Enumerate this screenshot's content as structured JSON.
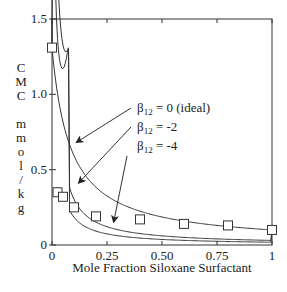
{
  "chart_data": {
    "type": "line",
    "title": "",
    "xlabel": "Mole Fraction Siloxane Surfactant",
    "ylabel": "CMC mmol/kg",
    "ylabel_chars": [
      "C",
      "M",
      "C",
      "",
      "m",
      "m",
      "o",
      "l",
      "/",
      "k",
      "g"
    ],
    "xlim": [
      0,
      1
    ],
    "ylim": [
      0,
      1.5
    ],
    "xticks": [
      0,
      0.25,
      0.5,
      0.75,
      1
    ],
    "xtick_labels": [
      "0",
      "0.25",
      "0.50",
      "0.75",
      "1"
    ],
    "yticks": [
      0,
      0.5,
      1.0,
      1.5
    ],
    "ytick_labels": [
      "0",
      "0.5",
      "1.0",
      "1.5"
    ],
    "grid": false,
    "cmc_pure": {
      "x0": 1.31,
      "x1": 0.1
    },
    "series": [
      {
        "name": "β12 = 0 (ideal)",
        "beta": 0,
        "kind": "curve"
      },
      {
        "name": "β12 = -2",
        "beta": -2,
        "kind": "curve"
      },
      {
        "name": "β12 = -4",
        "beta": -4,
        "kind": "curve"
      },
      {
        "name": "experimental",
        "kind": "points",
        "marker": "square",
        "x": [
          0,
          0.025,
          0.05,
          0.1,
          0.2,
          0.4,
          0.6,
          0.8,
          1.0
        ],
        "y": [
          1.31,
          0.35,
          0.32,
          0.25,
          0.19,
          0.17,
          0.14,
          0.13,
          0.1
        ]
      }
    ],
    "annotations": [
      {
        "label_main": "β",
        "label_sub": "12",
        "label_rest": "= 0 (ideal)",
        "arrow_to": [
          0.11,
          0.68
        ]
      },
      {
        "label_main": "β",
        "label_sub": "12",
        "label_rest": "= -2",
        "arrow_to": [
          0.12,
          0.41
        ]
      },
      {
        "label_main": "β",
        "label_sub": "12",
        "label_rest": "= -4",
        "arrow_to": [
          0.28,
          0.15
        ]
      }
    ]
  }
}
